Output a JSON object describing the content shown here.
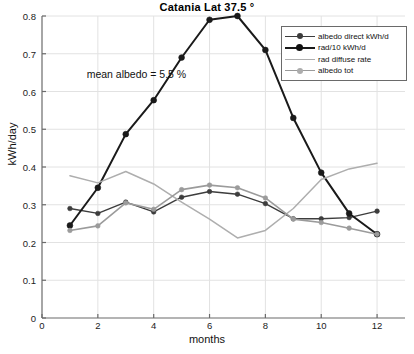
{
  "chart_data": {
    "type": "line",
    "title": "Catania  Lat 37.5 °",
    "xlabel": "months",
    "ylabel": "kWh/day",
    "xlim": [
      0,
      13
    ],
    "ylim": [
      0,
      0.8
    ],
    "grid": true,
    "legend_position": "top-right",
    "xticks": [
      0,
      2,
      4,
      6,
      8,
      10,
      12
    ],
    "xtick_labels": [
      "0",
      "2",
      "4",
      "6",
      "8",
      "10",
      "12"
    ],
    "yticks": [
      0,
      0.1,
      0.2,
      0.3,
      0.4,
      0.5,
      0.6,
      0.7,
      0.8
    ],
    "ytick_labels": [
      "0",
      "0.1",
      "0.2",
      "0.3",
      "0.4",
      "0.5",
      "0.6",
      "0.7",
      "0.8"
    ],
    "annotations": [
      {
        "text": "mean albedo = 5.5 %",
        "x": 1.6,
        "y": 0.645
      }
    ],
    "x": [
      1,
      2,
      3,
      4,
      5,
      6,
      7,
      8,
      9,
      10,
      11,
      12
    ],
    "series": [
      {
        "name": "albedo direct kWh/d",
        "color": "#3d3d3d",
        "marker": "circle",
        "values": [
          0.29,
          0.277,
          0.307,
          0.281,
          0.32,
          0.335,
          0.328,
          0.303,
          0.263,
          0.263,
          0.266,
          0.283
        ]
      },
      {
        "name": "rad/10 kWh/d",
        "color": "#1a1a1a",
        "marker": "circle",
        "values": [
          0.245,
          0.345,
          0.487,
          0.577,
          0.69,
          0.79,
          0.8,
          0.71,
          0.53,
          0.385,
          0.277,
          0.222
        ]
      },
      {
        "name": "rad diffuse rate",
        "color": "#aeaeae",
        "marker": "none",
        "values": [
          0.377,
          0.358,
          0.388,
          0.355,
          0.307,
          0.262,
          0.212,
          0.232,
          0.29,
          0.367,
          0.395,
          0.41
        ]
      },
      {
        "name": "albedo tot",
        "color": "#9b9b9b",
        "marker": "circle",
        "values": [
          0.232,
          0.244,
          0.305,
          0.288,
          0.34,
          0.352,
          0.345,
          0.318,
          0.262,
          0.253,
          0.238,
          0.222
        ]
      }
    ]
  },
  "legend": {
    "items": [
      {
        "label": "albedo direct kWh/d"
      },
      {
        "label": "rad/10 kWh/d"
      },
      {
        "label": "rad diffuse rate"
      },
      {
        "label": "albedo tot"
      }
    ]
  }
}
